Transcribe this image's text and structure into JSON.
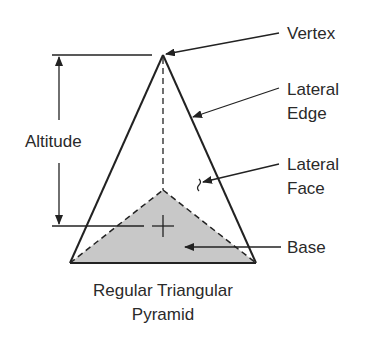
{
  "diagram": {
    "title_line1": "Regular Triangular",
    "title_line2": "Pyramid",
    "labels": {
      "vertex": "Vertex",
      "lateral_edge_1": "Lateral",
      "lateral_edge_2": "Edge",
      "lateral_face_1": "Lateral",
      "lateral_face_2": "Face",
      "base": "Base",
      "altitude": "Altitude"
    },
    "colors": {
      "line": "#222222",
      "base_fill": "#c8c8c8",
      "text": "#2a2a2a",
      "background": "#ffffff"
    }
  }
}
